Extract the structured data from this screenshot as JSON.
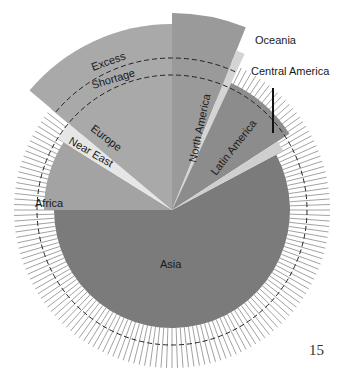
{
  "chart_data": {
    "type": "pie",
    "title": "",
    "center": [
      172,
      210
    ],
    "reference_circles": [
      {
        "name": "Shortage",
        "radius": 135
      },
      {
        "name": "Excess",
        "radius": 152
      }
    ],
    "tick_ring": {
      "inner_radius": 118,
      "outer_radius": 158,
      "count": 180
    },
    "annotations": [
      "Excess",
      "Shortage"
    ],
    "series": [
      {
        "name": "Asia",
        "start_deg": 62,
        "end_deg": 270,
        "radius": 118,
        "color": "#7b7b7b"
      },
      {
        "name": "Africa",
        "start_deg": 270,
        "end_deg": 302,
        "radius": 128,
        "color": "#a3a3a3"
      },
      {
        "name": "Near East",
        "start_deg": 302,
        "end_deg": 310,
        "radius": 135,
        "color": "#e6e6e6"
      },
      {
        "name": "Europe",
        "start_deg": 310,
        "end_deg": 360,
        "radius": 186,
        "color": "#a9a9a9"
      },
      {
        "name": "North America",
        "start_deg": 0,
        "end_deg": 22,
        "radius": 197,
        "color": "#9a9a9a"
      },
      {
        "name": "Oceania",
        "start_deg": 22,
        "end_deg": 25,
        "radius": 172,
        "color": "#d4d4d4"
      },
      {
        "name": "Latin America",
        "start_deg": 25,
        "end_deg": 57,
        "radius": 140,
        "color": "#8c8c8c"
      },
      {
        "name": "Central America",
        "start_deg": 57,
        "end_deg": 62,
        "radius": 126,
        "color": "#cfcfcf"
      }
    ]
  },
  "labels": {
    "excess": "Excess",
    "shortage": "Shortage",
    "europe": "Europe",
    "near_east": "Near East",
    "africa": "Africa",
    "asia": "Asia",
    "north_america": "North America",
    "oceania": "Oceania",
    "latin_america": "Latin America",
    "central_america": "Central America"
  },
  "page_number": "15"
}
